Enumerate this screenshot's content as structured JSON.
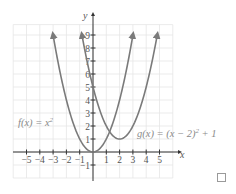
{
  "chart_data": {
    "type": "line",
    "title": "",
    "xlabel": "x",
    "ylabel": "y",
    "xlim": [
      -6,
      6
    ],
    "ylim": [
      -2,
      10
    ],
    "grid": true,
    "x_ticks": [
      -5,
      -4,
      -3,
      -2,
      -1,
      1,
      2,
      3,
      4,
      5
    ],
    "x_tick_labels": [
      "−5",
      "−4",
      "−3",
      "−2",
      "−1",
      "1",
      "2",
      "3",
      "4",
      "5"
    ],
    "y_ticks": [
      -1,
      1,
      2,
      3,
      4,
      5,
      6,
      7,
      8,
      9
    ],
    "y_tick_labels": [
      "−1",
      "1",
      "2",
      "3",
      "4",
      "5",
      "6",
      "7",
      "8",
      "9"
    ],
    "series": [
      {
        "name": "f(x) = x²",
        "label": "f(x) = x²",
        "expression": "x^2",
        "x": [
          -3,
          -2,
          -1,
          0,
          1,
          2,
          3
        ],
        "values": [
          9,
          4,
          1,
          0,
          1,
          4,
          9
        ],
        "color": "#7a7a7a"
      },
      {
        "name": "g(x) = (x − 2)² + 1",
        "label": "g(x) = (x − 2)² + 1",
        "expression": "(x-2)^2+1",
        "x": [
          -0.83,
          0,
          1,
          2,
          3,
          4,
          4.83
        ],
        "values": [
          9,
          5,
          2,
          1,
          2,
          5,
          9
        ],
        "color": "#7a7a7a"
      }
    ],
    "annotations": [
      {
        "text": "f(x) = x²",
        "near": [
          -4.5,
          2.8
        ]
      },
      {
        "text": "g(x) = (x − 2)² + 1",
        "near": [
          4.5,
          1.5
        ]
      }
    ]
  },
  "labels": {
    "x_axis": "x",
    "y_axis": "y",
    "f_label_main": "f(x) = x",
    "f_label_exp": "2",
    "g_label_main": "g(x) = (x − 2)",
    "g_label_exp": "2",
    "g_label_tail": " + 1"
  },
  "checkbox": {
    "checked": false
  }
}
